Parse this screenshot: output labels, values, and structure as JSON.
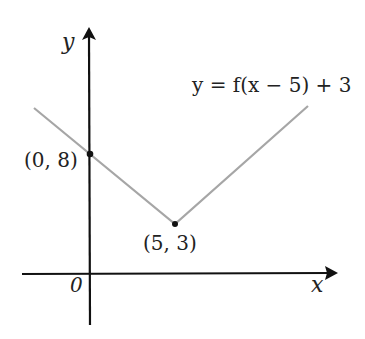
{
  "diagram": {
    "equation_label": "y = f(x − 5) + 3",
    "axes": {
      "x_label": "x",
      "y_label": "y",
      "origin_label": "0"
    },
    "points": [
      {
        "label": "(0, 8)",
        "x": 0,
        "y": 8
      },
      {
        "label": "(5, 3)",
        "x": 5,
        "y": 3
      }
    ],
    "line_color": "#a6a6a6",
    "axis_color": "#111111"
  }
}
